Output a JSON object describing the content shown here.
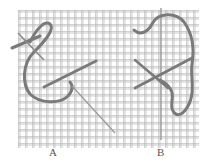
{
  "figure": {
    "colors": {
      "background": "#ffffff",
      "canvas_thread": "#b8b8b8",
      "wool": "#7a7a7a",
      "needle": "#9a9a9a",
      "label": "#555555"
    },
    "canvas": {
      "x": 18,
      "y": 10,
      "width": 181,
      "height": 138,
      "cell": 7
    },
    "panels": [
      {
        "id": "A",
        "label": "A"
      },
      {
        "id": "B",
        "label": "B"
      }
    ]
  }
}
